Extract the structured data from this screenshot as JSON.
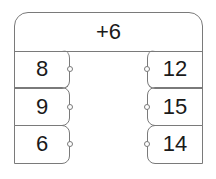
{
  "header": {
    "rule": "+6"
  },
  "table": {
    "inputs": [
      "8",
      "9",
      "6"
    ],
    "outputs": [
      "12",
      "15",
      "14"
    ]
  }
}
